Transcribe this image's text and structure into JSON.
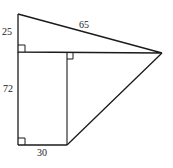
{
  "diagram": {
    "type": "geometry-figure",
    "labels": {
      "top_left_side": "25",
      "hypotenuse_top": "65",
      "left_side": "72",
      "bottom_side": "30"
    },
    "right_angle_markers": 3,
    "colors": {
      "stroke": "#1a1a1a",
      "text": "#222222",
      "background": "#ffffff"
    }
  }
}
